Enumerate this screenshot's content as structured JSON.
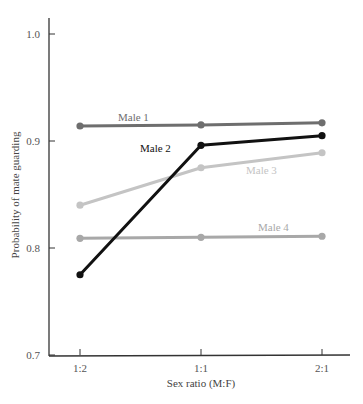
{
  "chart_data": {
    "type": "line",
    "title": "",
    "xlabel": "Sex ratio (M:F)",
    "ylabel": "Probability of mate guarding",
    "categories": [
      "1:2",
      "1:1",
      "2:1"
    ],
    "ylim": [
      0.7,
      1.0
    ],
    "yticks": [
      "0.7",
      "0.8",
      "0.9",
      "1.0"
    ],
    "grid": false,
    "legend": "inline labels",
    "series": [
      {
        "name": "Male 1",
        "values": [
          0.914,
          0.915,
          0.917
        ],
        "color": "#6e6e6e",
        "label_pos": [
          118,
          121
        ]
      },
      {
        "name": "Male 2",
        "values": [
          0.775,
          0.896,
          0.905
        ],
        "color": "#111111",
        "label_pos": [
          140,
          152
        ]
      },
      {
        "name": "Male 3",
        "values": [
          0.84,
          0.875,
          0.889
        ],
        "color": "#c4c4c4",
        "label_pos": [
          246,
          174
        ]
      },
      {
        "name": "Male 4",
        "values": [
          0.809,
          0.81,
          0.811
        ],
        "color": "#a8a8a8",
        "label_pos": [
          258,
          231
        ]
      }
    ]
  }
}
